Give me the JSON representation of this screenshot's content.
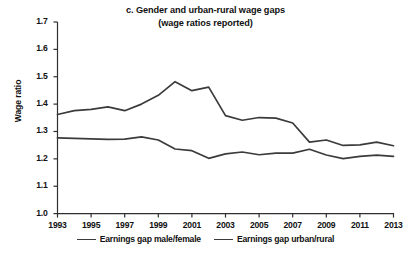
{
  "chart_data": {
    "type": "line",
    "title": "c. Gender and urban-rural wage gaps",
    "subtitle": "(wage ratios reported)",
    "xlabel": "",
    "ylabel": "Wage ratio",
    "ylim": [
      1.0,
      1.7
    ],
    "xlim": [
      1993,
      2013
    ],
    "yticks": [
      "1.0",
      "1.1",
      "1.2",
      "1.3",
      "1.4",
      "1.5",
      "1.6",
      "1.7"
    ],
    "ytick_values": [
      1.0,
      1.1,
      1.2,
      1.3,
      1.4,
      1.5,
      1.6,
      1.7
    ],
    "xticks": [
      "1993",
      "1995",
      "1997",
      "1999",
      "2001",
      "2003",
      "2005",
      "2007",
      "2009",
      "2011",
      "2013"
    ],
    "xtick_values": [
      1993,
      1995,
      1997,
      1999,
      2001,
      2003,
      2005,
      2007,
      2009,
      2011,
      2013
    ],
    "x": [
      1993,
      1994,
      1995,
      1996,
      1997,
      1998,
      1999,
      2000,
      2001,
      2002,
      2003,
      2004,
      2005,
      2006,
      2007,
      2008,
      2009,
      2010,
      2011,
      2012,
      2013
    ],
    "grid": false,
    "legend_position": "bottom",
    "line_color": "#3b3b3b",
    "series": [
      {
        "name": "Earnings gap male/female",
        "color": "#3b3b3b",
        "values": [
          1.362,
          1.376,
          1.381,
          1.39,
          1.376,
          1.4,
          1.432,
          1.482,
          1.449,
          1.462,
          1.358,
          1.341,
          1.351,
          1.349,
          1.331,
          1.261,
          1.269,
          1.249,
          1.251,
          1.261,
          1.248
        ]
      },
      {
        "name": "Earnings gap urban/rural",
        "color": "#3b3b3b",
        "values": [
          1.277,
          1.275,
          1.273,
          1.271,
          1.272,
          1.28,
          1.269,
          1.236,
          1.23,
          1.202,
          1.218,
          1.225,
          1.215,
          1.221,
          1.221,
          1.235,
          1.214,
          1.201,
          1.209,
          1.214,
          1.209
        ]
      }
    ]
  },
  "legend": {
    "entries": [
      {
        "label": "Earnings gap male/female"
      },
      {
        "label": "Earnings gap urban/rural"
      }
    ]
  }
}
